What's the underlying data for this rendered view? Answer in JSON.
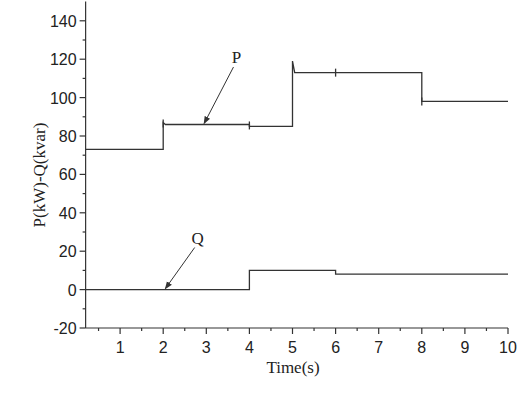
{
  "chart_data": {
    "type": "line",
    "title": "",
    "xlabel": "Time(s)",
    "ylabel": "P(kW)-Q(kvar)",
    "xlim": [
      0.2,
      10
    ],
    "ylim": [
      -20,
      150
    ],
    "xticks": [
      1,
      2,
      3,
      4,
      5,
      6,
      7,
      8,
      9,
      10
    ],
    "yticks": [
      -20,
      0,
      20,
      40,
      60,
      80,
      100,
      120,
      140
    ],
    "grid": false,
    "legend": null,
    "series": [
      {
        "name": "P",
        "unit": "kW",
        "step": true,
        "points": [
          [
            0.2,
            73
          ],
          [
            2.0,
            73
          ],
          [
            2.0,
            87
          ],
          [
            2.05,
            86
          ],
          [
            4.0,
            86
          ],
          [
            4.0,
            85
          ],
          [
            5.0,
            85
          ],
          [
            5.0,
            119
          ],
          [
            5.05,
            113
          ],
          [
            8.0,
            113
          ],
          [
            8.0,
            98
          ],
          [
            10.0,
            98
          ]
        ]
      },
      {
        "name": "Q",
        "unit": "kvar",
        "step": true,
        "points": [
          [
            0.2,
            0
          ],
          [
            4.0,
            0
          ],
          [
            4.0,
            10
          ],
          [
            6.0,
            10
          ],
          [
            6.0,
            8
          ],
          [
            10.0,
            8
          ]
        ]
      }
    ],
    "annotations": [
      {
        "text": "P",
        "label_at": [
          3.7,
          118
        ],
        "arrow_to": [
          2.95,
          86
        ]
      },
      {
        "text": "Q",
        "label_at": [
          2.8,
          24
        ],
        "arrow_to": [
          2.05,
          0
        ]
      }
    ]
  }
}
